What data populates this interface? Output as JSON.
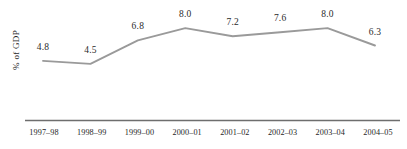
{
  "chart_data": {
    "type": "line",
    "title": "",
    "subtitle": "",
    "xlabel": "",
    "ylabel": "% of GDP",
    "categories": [
      "1997–98",
      "1998–99",
      "1999–00",
      "2000–01",
      "2001–02",
      "2002–03",
      "2003–04",
      "2004–05"
    ],
    "values": [
      4.8,
      4.5,
      6.8,
      8.0,
      7.2,
      7.6,
      8.0,
      6.3
    ],
    "point_labels": [
      "4.8",
      "4.5",
      "6.8",
      "8.0",
      "7.2",
      "7.6",
      "8.0",
      "6.3"
    ],
    "series": [
      {
        "name": "% of GDP",
        "values": [
          4.8,
          4.5,
          6.8,
          8.0,
          7.2,
          7.6,
          8.0,
          6.3
        ],
        "color": "#9a9a9a"
      }
    ],
    "ylim": [
      4.0,
      8.6
    ],
    "grid": false,
    "legend": false,
    "legend_position": "none",
    "y_axis_visible": false,
    "x_axis_visible": true,
    "data_labels_shown": true,
    "line_color": "#9a9a9a",
    "axis_color": "#6e6e6e",
    "text_color": "#1f1f1f",
    "background": "#ffffff"
  },
  "axis": {
    "y_title": "% of GDP"
  }
}
